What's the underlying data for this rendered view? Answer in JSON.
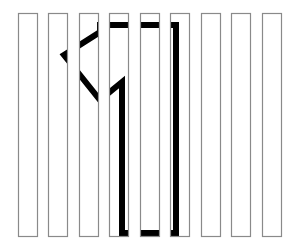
{
  "figure": {
    "description": "Nine vertical white bars (picket fence) through which a thick black outline of the digit 1 is partially visible",
    "hidden_shape": "1",
    "colors": {
      "background": "#ffffff",
      "bar_fill": "#ffffff",
      "bar_stroke": "#8a8a8a",
      "shape_stroke": "#000000"
    },
    "bars": [
      {
        "x": 18,
        "y": 13,
        "w": 20,
        "h": 224
      },
      {
        "x": 48,
        "y": 13,
        "w": 20,
        "h": 224
      },
      {
        "x": 79,
        "y": 13,
        "w": 20,
        "h": 224
      },
      {
        "x": 109,
        "y": 13,
        "w": 20,
        "h": 224
      },
      {
        "x": 140,
        "y": 13,
        "w": 20,
        "h": 224
      },
      {
        "x": 170,
        "y": 13,
        "w": 20,
        "h": 224
      },
      {
        "x": 201,
        "y": 13,
        "w": 20,
        "h": 224
      },
      {
        "x": 231,
        "y": 13,
        "w": 20,
        "h": 224
      },
      {
        "x": 262,
        "y": 13,
        "w": 20,
        "h": 224
      }
    ],
    "shape_outline": "M100,25 L176,25 L176,233 L122,233 L122,82 L100,100 L64,55 L100,32"
  }
}
